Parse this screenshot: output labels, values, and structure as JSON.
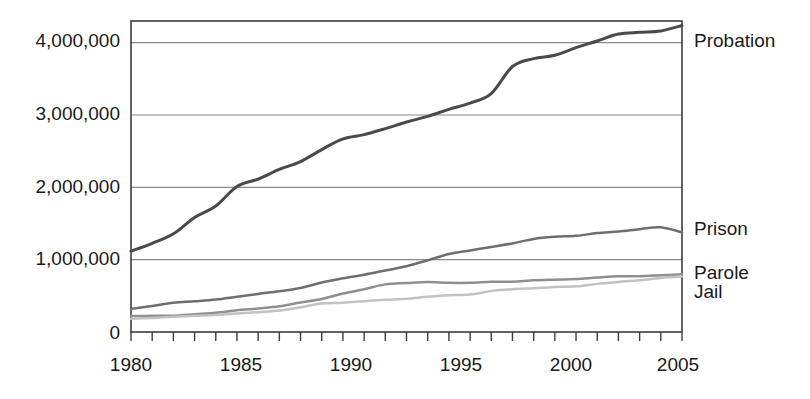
{
  "chart_data": {
    "type": "line",
    "title": "",
    "subtitle": "",
    "xlabel": "",
    "ylabel": "",
    "xlim": [
      1980,
      2006
    ],
    "ylim": [
      0,
      4300000
    ],
    "grid": true,
    "grid_axis": "y",
    "legend_position": "right-inline-end-of-line",
    "x": [
      1980,
      1981,
      1982,
      1983,
      1984,
      1985,
      1986,
      1987,
      1988,
      1989,
      1990,
      1991,
      1992,
      1993,
      1994,
      1995,
      1996,
      1997,
      1998,
      1999,
      2000,
      2001,
      2002,
      2003,
      2004,
      2005,
      2006
    ],
    "y_ticks": [
      0,
      1000000,
      2000000,
      3000000,
      4000000
    ],
    "y_tick_labels": [
      "0",
      "1,000,000",
      "2,000,000",
      "3,000,000",
      "4,000,000"
    ],
    "x_ticks": [
      1980,
      1981,
      1982,
      1983,
      1984,
      1985,
      1986,
      1987,
      1988,
      1989,
      1990,
      1991,
      1992,
      1993,
      1994,
      1995,
      1996,
      1997,
      1998,
      1999,
      2000,
      2001,
      2002,
      2003,
      2004,
      2005,
      2006
    ],
    "x_tick_labels_shown": [
      "1980",
      "1985",
      "1990",
      "1995",
      "2000",
      "2005"
    ],
    "x_tick_label_years": [
      1980,
      1985,
      1990,
      1995,
      2000,
      2005
    ],
    "series": [
      {
        "name": "Probation",
        "color": "#4a4a4a",
        "width": 3.0,
        "values": [
          1118097,
          1225934,
          1357264,
          1582947,
          1740948,
          2011578,
          2114621,
          2247158,
          2356483,
          2522125,
          2670234,
          2728472,
          2811611,
          2903061,
          2981022,
          3077861,
          3164996,
          3296513,
          3670441,
          3779922,
          3826209,
          3931731,
          4024067,
          4120012,
          4143792,
          4162536,
          4237023
        ]
      },
      {
        "name": "Prison",
        "color": "#6e6e6e",
        "width": 2.5,
        "values": [
          319598,
          360029,
          402914,
          423898,
          448264,
          487593,
          526436,
          562814,
          607766,
          683367,
          743382,
          792535,
          850566,
          909381,
          990147,
          1078542,
          1127528,
          1176564,
          1224469,
          1287172,
          1316333,
          1330007,
          1367547,
          1390279,
          1421345,
          1448344,
          1377815
        ]
      },
      {
        "name": "Parole",
        "color": "#8f8f8f",
        "width": 2.5,
        "values": [
          220438,
          225539,
          224604,
          246440,
          266992,
          300203,
          325638,
          355505,
          407977,
          456803,
          531407,
          590442,
          658601,
          676100,
          690371,
          679421,
          679733,
          694787,
          696385,
          714457,
          723898,
          732333,
          753141,
          769925,
          771852,
          784408,
          798202
        ]
      },
      {
        "name": "Jail",
        "color": "#c2c2c2",
        "width": 2.5,
        "values": [
          182288,
          195085,
          209582,
          223551,
          234500,
          256615,
          274444,
          295873,
          343569,
          395553,
          405320,
          426479,
          444584,
          459804,
          486474,
          507044,
          518492,
          567079,
          592462,
          605943,
          621149,
          631240,
          665475,
          691301,
          713990,
          747529,
          766010
        ]
      }
    ]
  },
  "plot_area": {
    "left": 131,
    "right": 682,
    "top": 21,
    "bottom": 332,
    "border_color": "#3c3c3c",
    "gridline_color": "#8a8a8a"
  },
  "labels": {
    "probation": "Probation",
    "prison": "Prison",
    "parole": "Parole",
    "jail": "Jail"
  },
  "axis": {
    "y0": "0",
    "y1": "1,000,000",
    "y2": "2,000,000",
    "y3": "3,000,000",
    "y4": "4,000,000",
    "x0": "1980",
    "x1": "1985",
    "x2": "1990",
    "x3": "1995",
    "x4": "2000",
    "x5": "2005"
  }
}
